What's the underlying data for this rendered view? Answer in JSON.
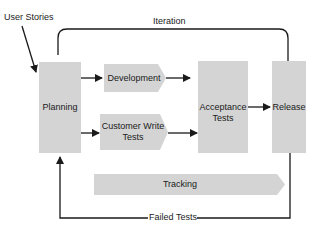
{
  "diagram": {
    "labels": {
      "user_stories": "User Stories",
      "iteration": "Iteration",
      "planning": "Planning",
      "development": "Development",
      "customer_write_tests_line1": "Customer Write",
      "customer_write_tests_line2": "Tests",
      "acceptance_tests_line1": "Acceptance",
      "acceptance_tests_line2": "Tests",
      "release": "Release",
      "tracking": "Tracking",
      "failed_tests": "Failed Tests"
    },
    "colors": {
      "box_fill": "#d4d4d4",
      "line": "#1a1a1a",
      "background": "#ffffff"
    }
  }
}
